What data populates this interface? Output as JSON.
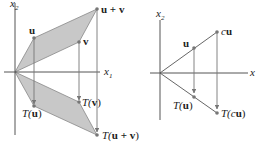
{
  "colors": {
    "axis": "#555555",
    "fill": "#c8c8c8",
    "edge": "#888888",
    "arrow": "#777777",
    "point": "#777777",
    "text": "#222222"
  },
  "left_diagram": {
    "axis_labels": {
      "x": "x",
      "x_sub": "1",
      "y": "x",
      "y_sub": "2"
    },
    "points": {
      "u": {
        "label": "u"
      },
      "v": {
        "label": "v"
      },
      "u_plus_v": {
        "label": "u + v"
      },
      "T_u": {
        "label_T": "T(",
        "label_arg": "u",
        "label_close": ")"
      },
      "T_v": {
        "label_T": "T(",
        "label_arg": "v",
        "label_close": ")"
      },
      "T_u_plus_v": {
        "label_T": "T(",
        "label_arg": "u + v",
        "label_close": ")"
      }
    }
  },
  "right_diagram": {
    "axis_labels": {
      "x": "x",
      "y": "x",
      "y_sub": "2"
    },
    "points": {
      "u": {
        "label": "u"
      },
      "cu": {
        "label_c": "c",
        "label_u": "u"
      },
      "T_u": {
        "label_T": "T(",
        "label_arg": "u",
        "label_close": ")"
      },
      "T_cu": {
        "label_T": "T(",
        "label_c": "c",
        "label_arg": "u",
        "label_close": ")"
      }
    }
  }
}
